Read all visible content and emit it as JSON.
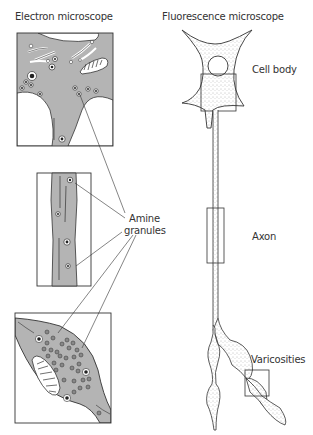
{
  "titles": {
    "left": "Electron microscope",
    "right": "Fluorescence microscope"
  },
  "labels": {
    "cell_body": "Cell body",
    "axon": "Axon",
    "amine_line1": "Amine",
    "amine_line2": "granules",
    "varicosities": "Varicosities"
  },
  "colors": {
    "cytoplasm": "#b4b4b4",
    "outline": "#333333",
    "background": "#ffffff"
  },
  "panels": [
    {
      "name": "cell-body-em",
      "region": "top-left"
    },
    {
      "name": "axon-em",
      "region": "middle-left"
    },
    {
      "name": "varicosity-em",
      "region": "bottom-left"
    }
  ]
}
